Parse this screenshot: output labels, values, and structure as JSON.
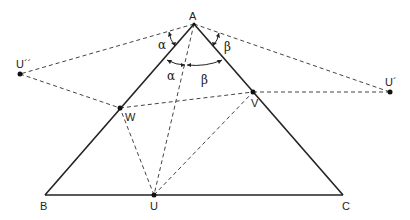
{
  "diagram": {
    "type": "geometry-reflection-construction",
    "colors": {
      "stroke": "#222222",
      "dashed": "#444444",
      "background": "#ffffff"
    },
    "points": {
      "A": {
        "label": "A",
        "x": 194,
        "y": 24
      },
      "B": {
        "label": "B",
        "x": 45,
        "y": 195
      },
      "C": {
        "label": "C",
        "x": 343,
        "y": 195
      },
      "U": {
        "label": "U",
        "x": 154,
        "y": 195
      },
      "U1": {
        "label": "U´",
        "x": 390,
        "y": 92
      },
      "U2": {
        "label": "U´´",
        "x": 20,
        "y": 74
      },
      "V": {
        "label": "V",
        "x": 253,
        "y": 92
      },
      "W": {
        "label": "W",
        "x": 120,
        "y": 108
      }
    },
    "solid_segments": [
      "A-B",
      "B-C",
      "C-A"
    ],
    "dashed_segments": [
      "A-U",
      "A-U2",
      "A-U1",
      "U2-W",
      "W-V",
      "V-U1",
      "U-W",
      "U-V"
    ],
    "angle_labels": {
      "alpha": "α",
      "beta": "β"
    }
  }
}
